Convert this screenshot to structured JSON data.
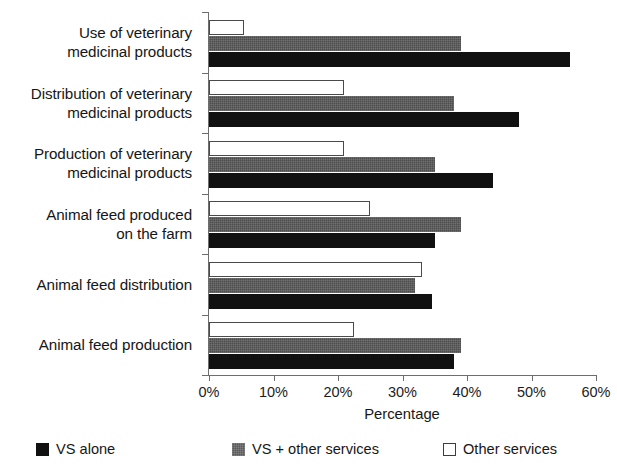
{
  "chart_data": {
    "type": "bar",
    "orientation": "horizontal",
    "title": "",
    "xlabel": "Percentage",
    "ylabel": "",
    "xlim": [
      0,
      60
    ],
    "xticks": [
      "0%",
      "10%",
      "20%",
      "30%",
      "40%",
      "50%",
      "60%"
    ],
    "xtick_values": [
      0,
      10,
      20,
      30,
      40,
      50,
      60
    ],
    "grid": false,
    "legend_position": "bottom",
    "categories": [
      "Use of veterinary medicinal products",
      "Distribution of veterinary medicinal products",
      "Production of veterinary medicinal products",
      "Animal feed produced on the farm",
      "Animal feed distribution",
      "Animal feed production"
    ],
    "category_lines": [
      [
        "Use of veterinary",
        "medicinal products"
      ],
      [
        "Distribution of veterinary",
        "medicinal products"
      ],
      [
        "Production of veterinary",
        "medicinal products"
      ],
      [
        "Animal feed produced",
        "on the farm"
      ],
      [
        "Animal feed distribution"
      ],
      [
        "Animal feed production"
      ]
    ],
    "series": [
      {
        "name": "VS alone",
        "color": "#111111",
        "style": "solid-black",
        "values": [
          56,
          48,
          44,
          35,
          34.5,
          38
        ]
      },
      {
        "name": "VS + other services",
        "color": "#4d4d4d",
        "style": "gray-hatch",
        "values": [
          39,
          38,
          35,
          39,
          32,
          39
        ]
      },
      {
        "name": "Other services",
        "color": "#ffffff",
        "style": "white-outline",
        "values": [
          5.4,
          21,
          21,
          25,
          33,
          22.5
        ]
      }
    ]
  },
  "legend": {
    "items": [
      {
        "label": "VS alone",
        "swatch": "black"
      },
      {
        "label": "VS + other services",
        "swatch": "gray"
      },
      {
        "label": "Other services",
        "swatch": "white"
      }
    ]
  },
  "axis": {
    "x_title": "Percentage"
  },
  "colors": {
    "series_vs_alone": "#111111",
    "series_vs_other": "#4d4d4d",
    "series_other": "#ffffff",
    "axis": "#6e6e6e",
    "text": "#161616",
    "background": "#ffffff"
  }
}
